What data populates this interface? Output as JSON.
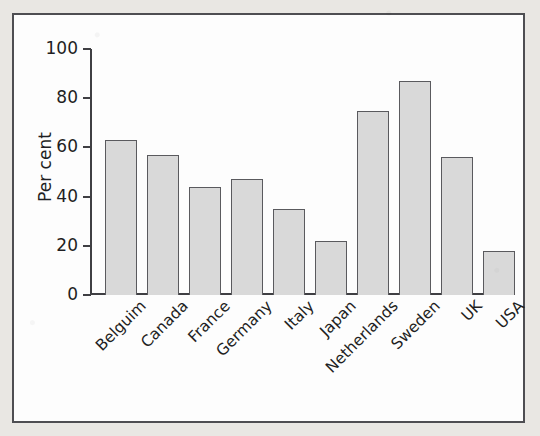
{
  "figure": {
    "frame_border_color": "#4e4e52",
    "page_background": "#e9e7e3",
    "plot_background": "#fdfdfd"
  },
  "chart_data": {
    "type": "bar",
    "title": "",
    "subtitle": "",
    "xlabel": "",
    "ylabel": "Per cent",
    "categories": [
      "Belguim",
      "Canada",
      "France",
      "Germany",
      "Italy",
      "Japan",
      "Netherlands",
      "Sweden",
      "UK",
      "USA"
    ],
    "values": [
      63,
      57,
      44,
      47,
      35,
      22,
      75,
      87,
      56,
      18
    ],
    "ylim": [
      0,
      100
    ],
    "yticks": [
      0,
      20,
      40,
      60,
      80,
      100
    ],
    "ytick_labels": [
      "0",
      "20",
      "40",
      "60",
      "80",
      "100"
    ],
    "grid": false,
    "legend": null,
    "bar_fill_color": "#d9d9d9",
    "bar_edge_color": "#5a5a5e",
    "axis_color": "#3f3f43",
    "xtick_label_rotation": -45
  }
}
